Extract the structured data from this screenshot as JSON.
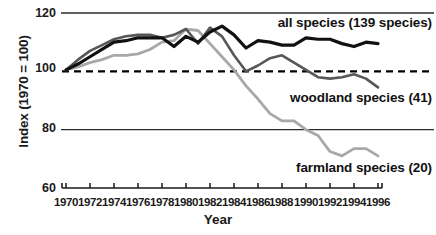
{
  "chart_data": {
    "type": "line",
    "title": "",
    "xlabel": "Year",
    "ylabel": "Index (1970 = 100)",
    "xlim": [
      1970,
      1996
    ],
    "ylim": [
      60,
      120
    ],
    "yticks": [
      60,
      80,
      100,
      120
    ],
    "xticks": [
      1970,
      1972,
      1974,
      1976,
      1978,
      1980,
      1982,
      1984,
      1986,
      1988,
      1990,
      1992,
      1994,
      1996
    ],
    "grid": "horizontal-rules-at-80-and-120",
    "legend_position": "inline-annotations-right",
    "reference_line": {
      "value": 100,
      "style": "dashed",
      "color": "#000000"
    },
    "x": [
      1970,
      1971,
      1972,
      1973,
      1974,
      1975,
      1976,
      1977,
      1978,
      1979,
      1980,
      1981,
      1982,
      1983,
      1984,
      1985,
      1986,
      1987,
      1988,
      1989,
      1990,
      1991,
      1992,
      1993,
      1994,
      1995,
      1996
    ],
    "series": [
      {
        "name": "all species (139 species)",
        "label": "all species (139 species)",
        "count": 139,
        "color": "#111111",
        "width": 3.2,
        "values": [
          100.5,
          102.5,
          105.0,
          107.5,
          110.0,
          110.5,
          111.5,
          111.5,
          111.5,
          108.5,
          112.0,
          110.0,
          113.5,
          115.5,
          112.5,
          108.0,
          110.5,
          110.0,
          109.0,
          109.0,
          111.5,
          111.0,
          111.0,
          109.5,
          108.5,
          110.0,
          109.5
        ]
      },
      {
        "name": "woodland species (41)",
        "label": "woodland species (41)",
        "count": 41,
        "color": "#575757",
        "width": 2.6,
        "values": [
          100.5,
          104.0,
          107.0,
          109.0,
          111.0,
          112.0,
          112.5,
          112.5,
          111.5,
          112.5,
          114.5,
          109.5,
          115.0,
          112.0,
          105.5,
          100.0,
          102.0,
          104.5,
          105.5,
          103.0,
          100.5,
          98.0,
          97.5,
          98.0,
          99.0,
          97.5,
          94.5
        ]
      },
      {
        "name": "farmland species (20)",
        "label": "farmland species (20)",
        "count": 20,
        "color": "#a8a8a8",
        "width": 2.8,
        "values": [
          100.5,
          101.5,
          103.0,
          104.0,
          105.5,
          105.5,
          106.0,
          107.5,
          110.0,
          110.5,
          114.5,
          114.0,
          109.5,
          105.0,
          100.5,
          95.0,
          90.5,
          85.5,
          83.0,
          83.0,
          80.0,
          78.0,
          72.5,
          71.0,
          73.5,
          73.5,
          71.0
        ]
      }
    ]
  }
}
